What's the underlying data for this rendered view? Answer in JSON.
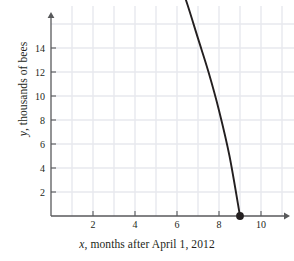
{
  "chart_data": {
    "type": "line",
    "title": "",
    "xlabel_prefix": "x",
    "xlabel_rest": ", months after April 1, 2012",
    "ylabel_prefix": "y",
    "ylabel_rest": ", thousands of bees",
    "xlim": [
      0,
      11.4
    ],
    "ylim": [
      0,
      15.6
    ],
    "xticks": [
      2,
      4,
      6,
      8,
      10
    ],
    "xtick_labels": [
      "2",
      "4",
      "6",
      "8",
      "10"
    ],
    "yticks": [
      2,
      4,
      6,
      8,
      10,
      12,
      14
    ],
    "ytick_labels": [
      "2",
      "4",
      "6",
      "8",
      "10",
      "12",
      "14"
    ],
    "grid": true,
    "grid_color": "#e7e9ee",
    "axis_color": "#58595b",
    "curve_color": "#231f20",
    "marker_color": "#231f20",
    "legend": "none",
    "series": [
      {
        "name": "bee population",
        "x": [
          0,
          0.5,
          1,
          1.5,
          2,
          2.5,
          3,
          3.5,
          4,
          4.5,
          5,
          5.5,
          6,
          6.5,
          7,
          7.5,
          8,
          8.5,
          9
        ],
        "y": [
          10,
          11.65,
          13.0,
          14.1,
          14.7,
          14.95,
          15.0,
          14.75,
          14.2,
          13.4,
          12.4,
          11.3,
          10.1,
          8.8,
          7.4,
          6.0,
          4.4,
          2.5,
          0
        ]
      }
    ],
    "marked_points": [
      {
        "label": "start",
        "x": 0,
        "y": 10
      },
      {
        "label": "end",
        "x": 9,
        "y": 0
      }
    ],
    "annotations": []
  }
}
